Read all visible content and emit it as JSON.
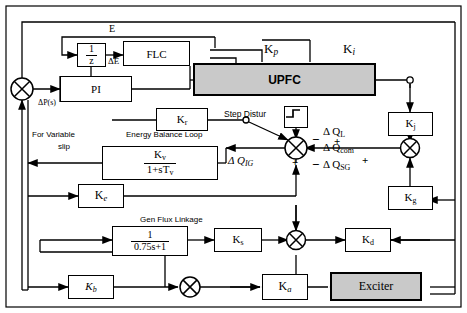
{
  "diagram": {
    "border_color": "#000000",
    "shade_color": "#c9c9c9"
  },
  "blocks": {
    "inv_z": {
      "num": "1",
      "den": "z",
      "name": "unit-delay-block"
    },
    "flc": {
      "label": "FLC"
    },
    "pi": {
      "label": "PI"
    },
    "upfc": {
      "label": "UPFC"
    },
    "kr": {
      "k": "K",
      "sub": "r"
    },
    "kj": {
      "k": "K",
      "sub": "j"
    },
    "kg": {
      "k": "K",
      "sub": "g"
    },
    "kv_frac": {
      "num_k": "K",
      "num_sub": "v",
      "den": "1+sT",
      "den_sub": "v"
    },
    "ke": {
      "k": "K",
      "sub": "e"
    },
    "gen_flux": {
      "num": "1",
      "den": "0.75s+1"
    },
    "ks": {
      "k": "K",
      "sub": "s"
    },
    "kd": {
      "k": "K",
      "sub": "d"
    },
    "kb": {
      "k": "K",
      "sub": "b"
    },
    "ka": {
      "k": "K",
      "sub": "a"
    },
    "exciter": {
      "label": "Exciter"
    },
    "step": {
      "label": "step-waveform"
    }
  },
  "labels": {
    "e": "E",
    "delta_e": "ΔE",
    "kp": "K",
    "kp_sub": "p",
    "ki": "K",
    "ki_sub": "i",
    "delta_p": "ΔP(s)",
    "for_variable": "For Variable",
    "slip": "slip",
    "energy_loop": "Energy Balance Loop",
    "step_distur": "Step Distur",
    "gen_flux": "Gen Flux Linkage",
    "d_ql": "Δ Q",
    "d_ql_sub": "L",
    "d_qcom": "Δ Q",
    "d_qcom_sub": "com",
    "d_qsg": "Δ Q",
    "d_qsg_sub": "SG",
    "d_qig": "Δ Q",
    "d_qig_sub": "IG",
    "sign_minus_1": "−",
    "sign_minus_2": "−",
    "sign_plus_1": "+",
    "sign_plus_2": "+",
    "sign_plus_3": "+"
  }
}
